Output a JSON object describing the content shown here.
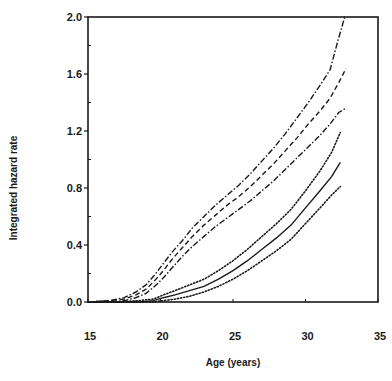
{
  "chart_data": {
    "type": "line",
    "title": "",
    "xlabel": "Age (years)",
    "ylabel": "Integrated hazard rate",
    "xlim": [
      15,
      35
    ],
    "ylim": [
      0.0,
      2.0
    ],
    "xticks": [
      15,
      20,
      25,
      30,
      35
    ],
    "xtick_labels": [
      "15",
      "20",
      "25",
      "30",
      "35"
    ],
    "yticks": [
      0.0,
      0.4,
      0.8,
      1.2,
      1.6,
      2.0
    ],
    "ytick_labels": [
      "0.0",
      "0.4",
      "0.8",
      "1.2",
      "1.6",
      "2.0"
    ],
    "yminor_ticks": [
      0.2,
      0.6,
      1.0,
      1.4,
      1.8
    ],
    "grid": false,
    "legend": null,
    "series": [
      {
        "name": "Group A upper bound",
        "style": "dashdot",
        "x": [
          15.0,
          16.5,
          17.5,
          18.3,
          19.0,
          19.6,
          20.2,
          20.8,
          21.5,
          22.2,
          23.0,
          23.8,
          24.6,
          25.4,
          26.2,
          27.0,
          27.8,
          28.6,
          29.4,
          30.2,
          31.0,
          31.7,
          32.2,
          32.7
        ],
        "y": [
          0.0,
          0.01,
          0.03,
          0.07,
          0.12,
          0.19,
          0.27,
          0.35,
          0.43,
          0.52,
          0.6,
          0.68,
          0.75,
          0.82,
          0.9,
          0.99,
          1.08,
          1.18,
          1.29,
          1.4,
          1.52,
          1.63,
          1.82,
          2.0
        ]
      },
      {
        "name": "Group A estimate",
        "style": "dashed",
        "x": [
          15.0,
          16.5,
          17.5,
          18.3,
          19.0,
          19.6,
          20.2,
          20.8,
          21.5,
          22.2,
          23.0,
          23.8,
          24.6,
          25.4,
          26.2,
          27.0,
          27.8,
          28.6,
          29.4,
          30.2,
          31.0,
          31.7,
          32.3,
          32.8
        ],
        "y": [
          0.0,
          0.01,
          0.02,
          0.05,
          0.09,
          0.15,
          0.22,
          0.3,
          0.38,
          0.46,
          0.54,
          0.61,
          0.68,
          0.74,
          0.81,
          0.89,
          0.97,
          1.06,
          1.15,
          1.25,
          1.34,
          1.43,
          1.54,
          1.64
        ]
      },
      {
        "name": "Group A lower bound",
        "style": "dashdot",
        "x": [
          15.0,
          16.5,
          17.5,
          18.3,
          19.0,
          19.6,
          20.2,
          20.8,
          21.5,
          22.2,
          23.0,
          23.8,
          24.6,
          25.4,
          26.2,
          27.0,
          27.8,
          28.6,
          29.4,
          30.2,
          31.0,
          31.7,
          32.3,
          32.8
        ],
        "y": [
          0.0,
          0.0,
          0.01,
          0.03,
          0.06,
          0.11,
          0.17,
          0.24,
          0.32,
          0.39,
          0.46,
          0.53,
          0.59,
          0.65,
          0.71,
          0.78,
          0.85,
          0.93,
          1.01,
          1.09,
          1.17,
          1.25,
          1.33,
          1.36
        ]
      },
      {
        "name": "Group B upper bound",
        "style": "dotted",
        "x": [
          15.0,
          17.0,
          18.5,
          19.5,
          20.2,
          21.0,
          22.0,
          23.0,
          24.0,
          25.0,
          26.0,
          27.0,
          28.0,
          29.0,
          30.0,
          31.0,
          31.8,
          32.4
        ],
        "y": [
          0.0,
          0.0,
          0.01,
          0.02,
          0.05,
          0.08,
          0.12,
          0.16,
          0.22,
          0.29,
          0.37,
          0.46,
          0.55,
          0.65,
          0.78,
          0.92,
          1.05,
          1.19
        ]
      },
      {
        "name": "Group B estimate",
        "style": "solid",
        "x": [
          15.0,
          17.0,
          18.5,
          19.5,
          20.2,
          21.0,
          22.0,
          23.0,
          24.0,
          25.0,
          26.0,
          27.0,
          28.0,
          29.0,
          30.0,
          31.0,
          31.8,
          32.4
        ],
        "y": [
          0.0,
          0.0,
          0.0,
          0.01,
          0.03,
          0.05,
          0.08,
          0.11,
          0.16,
          0.22,
          0.29,
          0.37,
          0.45,
          0.54,
          0.66,
          0.78,
          0.88,
          0.98
        ]
      },
      {
        "name": "Group B lower bound",
        "style": "dotted",
        "x": [
          15.0,
          17.0,
          18.5,
          19.5,
          20.2,
          21.0,
          22.0,
          23.0,
          24.0,
          25.0,
          26.0,
          27.0,
          28.0,
          29.0,
          30.0,
          31.0,
          31.8,
          32.4
        ],
        "y": [
          0.0,
          0.0,
          0.0,
          0.0,
          0.01,
          0.02,
          0.04,
          0.07,
          0.11,
          0.16,
          0.22,
          0.29,
          0.36,
          0.44,
          0.55,
          0.66,
          0.75,
          0.81
        ]
      }
    ]
  },
  "colors": {
    "ink": "#1a1a1a",
    "background": "#ffffff"
  }
}
